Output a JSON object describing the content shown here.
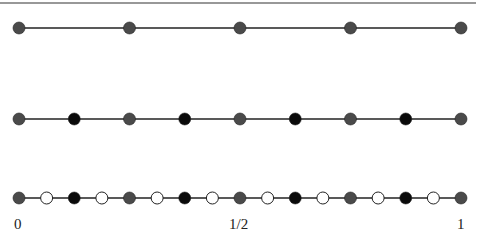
{
  "diagram": {
    "colors": {
      "gray": "#4a4a4a",
      "black": "#0a0a0a",
      "white": "#ffffff",
      "line": "#222222"
    },
    "rows": [
      {
        "level": 0,
        "y": 28,
        "points": [
          "gray",
          "gray",
          "gray",
          "gray",
          "gray"
        ]
      },
      {
        "level": 1,
        "y": 119,
        "points": [
          "gray",
          "black",
          "gray",
          "black",
          "gray",
          "black",
          "gray",
          "black",
          "gray"
        ]
      },
      {
        "level": 2,
        "y": 198,
        "points": [
          "gray",
          "white",
          "black",
          "white",
          "gray",
          "white",
          "black",
          "white",
          "gray",
          "white",
          "black",
          "white",
          "gray",
          "white",
          "black",
          "white",
          "gray"
        ]
      }
    ],
    "x_start": 19,
    "x_end": 461
  },
  "axis": {
    "labels": [
      {
        "text": "0",
        "x": 14
      },
      {
        "text": "1/2",
        "x": 229
      },
      {
        "text": "1",
        "x": 457
      }
    ]
  }
}
